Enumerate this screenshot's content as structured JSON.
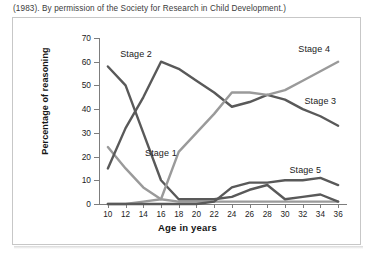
{
  "figure": {
    "caption": "(1983). By permission of the Society for Research in Child Development.)"
  },
  "chart_data": {
    "type": "line",
    "title": "",
    "xlabel": "Age in years",
    "ylabel": "Percentage of reasoning",
    "xlim": [
      9,
      37
    ],
    "ylim": [
      0,
      70
    ],
    "grid": false,
    "legend_position": "inline-annotations",
    "x": [
      10,
      12,
      14,
      16,
      18,
      20,
      22,
      24,
      26,
      28,
      30,
      32,
      34,
      36
    ],
    "xticks": [
      "10",
      "12",
      "14",
      "16",
      "18",
      "20",
      "22",
      "24",
      "26",
      "28",
      "30",
      "32",
      "34",
      "36"
    ],
    "yticks": [
      "0",
      "10",
      "20",
      "30",
      "40",
      "50",
      "60",
      "70"
    ],
    "series": [
      {
        "name": "Stage 1",
        "color": "#9a9a9a",
        "label_x": 14.2,
        "label_y": 21,
        "values": [
          24,
          15,
          7,
          2,
          1,
          1,
          1,
          1,
          1,
          1,
          1,
          1,
          1,
          1
        ]
      },
      {
        "name": "Stage 2",
        "color": "#595959",
        "label_x": 11.4,
        "label_y": 63,
        "values": [
          58,
          50,
          30,
          10,
          2,
          2,
          2,
          3,
          6,
          8,
          2,
          3,
          4,
          1
        ]
      },
      {
        "name": "Stage 3",
        "color": "#595959",
        "label_x": 32.2,
        "label_y": 43,
        "values": [
          15,
          32,
          45,
          60,
          57,
          52,
          47,
          41,
          43,
          46,
          44,
          40,
          37,
          33
        ]
      },
      {
        "name": "Stage 4",
        "color": "#9a9a9a",
        "label_x": 31.5,
        "label_y": 65,
        "values": [
          0,
          0,
          1,
          2,
          22,
          30,
          38,
          47,
          47,
          46,
          48,
          52,
          56,
          60
        ]
      },
      {
        "name": "Stage 5",
        "color": "#595959",
        "label_x": 30.5,
        "label_y": 14,
        "values": [
          0,
          0,
          0,
          0,
          0,
          0,
          1,
          7,
          9,
          9,
          10,
          10,
          11,
          8
        ]
      }
    ]
  }
}
